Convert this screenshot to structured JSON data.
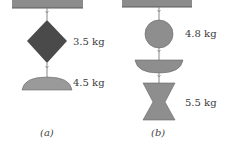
{
  "figure": {
    "panels": [
      {
        "caption": "(a)",
        "ceiling": {
          "x": 12,
          "y": 0,
          "w": 71,
          "h": 8
        },
        "objects": [
          {
            "shape": "diamond",
            "label": "3.5 kg",
            "color": "#4a4a4a"
          },
          {
            "shape": "dome",
            "label": "4.5 kg",
            "color": "#9a9a9a"
          }
        ]
      },
      {
        "caption": "(b)",
        "ceiling": {
          "x": 122,
          "y": 0,
          "w": 70,
          "h": 7
        },
        "objects": [
          {
            "shape": "circle",
            "label": "4.8 kg",
            "color": "#8e8e8e"
          },
          {
            "shape": "bowl",
            "label": "",
            "color": "#8e8e8e"
          },
          {
            "shape": "hourglass",
            "label": "5.5 kg",
            "color": "#8e8e8e"
          }
        ]
      }
    ],
    "colors": {
      "ceiling": "#8c8c8c",
      "ceiling_edge": "#5a5a5a",
      "string": "#888888",
      "dark_object": "#4a4a4a",
      "light_object": "#9a9a9a"
    }
  }
}
